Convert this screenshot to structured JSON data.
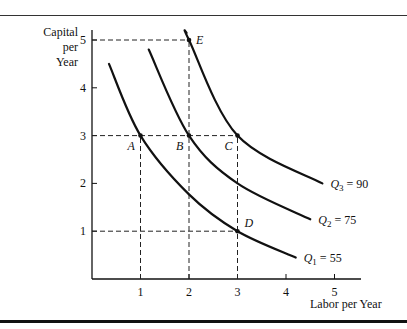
{
  "chart_data": {
    "type": "line",
    "title": "",
    "xlabel": "Labor per Year",
    "ylabel": "Capital per Year",
    "ylabel_lines": [
      "Capital",
      "per",
      "Year"
    ],
    "xlim": [
      0,
      5.5
    ],
    "ylim": [
      0,
      5.3
    ],
    "x_ticks": [
      1,
      2,
      3,
      4,
      5
    ],
    "y_ticks": [
      1,
      2,
      3,
      4,
      5
    ],
    "grid": false,
    "series": [
      {
        "name": "Q1 = 55",
        "label_sub": "1",
        "label_val": "55",
        "x": [
          0.35,
          1,
          2,
          3,
          4.2
        ],
        "y": [
          4.5,
          3,
          1.77,
          1,
          0.45
        ]
      },
      {
        "name": "Q2 = 75",
        "label_sub": "2",
        "label_val": "75",
        "x": [
          1.17,
          2,
          3,
          4.5
        ],
        "y": [
          4.8,
          3,
          2,
          1.25
        ]
      },
      {
        "name": "Q3 = 90",
        "label_sub": "3",
        "label_val": "90",
        "x": [
          1.95,
          2,
          3,
          4.75
        ],
        "y": [
          5.15,
          5,
          3,
          2.0
        ]
      }
    ],
    "points": [
      {
        "label": "A",
        "x": 1,
        "y": 3
      },
      {
        "label": "B",
        "x": 2,
        "y": 3
      },
      {
        "label": "C",
        "x": 3,
        "y": 3
      },
      {
        "label": "D",
        "x": 3,
        "y": 1
      },
      {
        "label": "E",
        "x": 2,
        "y": 5
      }
    ],
    "reference_lines": [
      {
        "type": "horizontal",
        "y": 5,
        "x_to": 2
      },
      {
        "type": "horizontal",
        "y": 3,
        "x_to": 3
      },
      {
        "type": "horizontal",
        "y": 1,
        "x_to": 3
      },
      {
        "type": "vertical",
        "x": 1,
        "y_to": 3
      },
      {
        "type": "vertical",
        "x": 2,
        "y_to": 5
      },
      {
        "type": "vertical",
        "x": 3,
        "y_to": 3
      }
    ]
  }
}
